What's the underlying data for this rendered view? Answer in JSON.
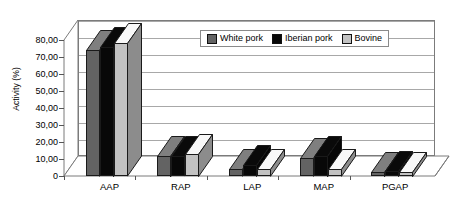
{
  "chart_data": {
    "type": "bar",
    "title": "",
    "xlabel": "",
    "ylabel": "Activity (%)",
    "ylim": [
      0,
      80
    ],
    "ytick_labels": [
      "0",
      "10,00",
      "20,00",
      "30,00",
      "40,00",
      "50,00",
      "60,00",
      "70,00",
      "80,00"
    ],
    "ytick_values": [
      0,
      10,
      20,
      30,
      40,
      50,
      60,
      70,
      80
    ],
    "categories": [
      "AAP",
      "RAP",
      "LAP",
      "MAP",
      "PGAP"
    ],
    "grid": true,
    "legend_position": "top-center",
    "series": [
      {
        "name": "White pork",
        "color": "#636363",
        "values": [
          74.0,
          12.0,
          4.0,
          10.5,
          2.5
        ]
      },
      {
        "name": "Iberian pork",
        "color": "#080808",
        "values": [
          76.0,
          11.5,
          6.5,
          12.0,
          3.0
        ]
      },
      {
        "name": "Bovine",
        "color": "#c2c2c2",
        "values": [
          78.0,
          13.0,
          4.0,
          4.0,
          2.5
        ]
      }
    ]
  },
  "legend": {
    "items": [
      {
        "label": "White pork"
      },
      {
        "label": "Iberian pork"
      },
      {
        "label": "Bovine"
      }
    ]
  }
}
